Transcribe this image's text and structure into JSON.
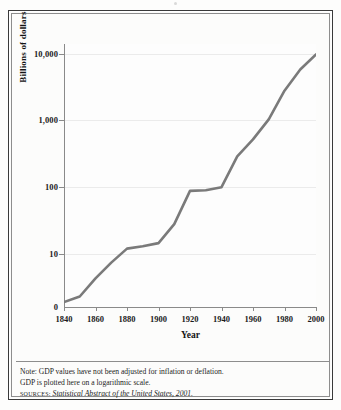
{
  "figure": {
    "background_color": "#fbfbfa",
    "frame_color": "#3a3a3a",
    "line_color": "#7a7a7a",
    "grid_color": "#ebebeb"
  },
  "notes": {
    "line1": "Note: GDP values have not been adjusted for inflation or deflation.",
    "line2": "GDP is plotted here on a logarithmic scale.",
    "source_label": "Sources:",
    "source_text": "Statistical Abstract of the United States, 2001."
  },
  "chart_data": {
    "type": "line",
    "title": "",
    "xlabel": "Year",
    "ylabel": "Billions of dollars",
    "yscale": "log",
    "grid": true,
    "legend": "none",
    "xlim": [
      1840,
      2000
    ],
    "ylim": [
      1.6,
      14000
    ],
    "xticks": [
      1840,
      1860,
      1880,
      1900,
      1920,
      1940,
      1960,
      1980,
      2000
    ],
    "xtick_labels": [
      "1840",
      "1860",
      "1880",
      "1900",
      "1920",
      "1940",
      "1960",
      "1980",
      "2000"
    ],
    "yticks": [
      10,
      100,
      1000,
      10000
    ],
    "ytick_labels": [
      "10",
      "100",
      "1,000",
      "10,000"
    ],
    "y_origin_label": "0",
    "series": [
      {
        "name": "GDP",
        "x": [
          1840,
          1850,
          1860,
          1870,
          1880,
          1890,
          1900,
          1910,
          1920,
          1930,
          1940,
          1950,
          1960,
          1970,
          1980,
          1990,
          2000
        ],
        "values": [
          1.9,
          2.3,
          4.3,
          7.4,
          12.0,
          13.0,
          14.5,
          28.0,
          88.0,
          90.0,
          100.0,
          290.0,
          520.0,
          1040.0,
          2790.0,
          5800.0,
          9800.0
        ]
      }
    ]
  }
}
